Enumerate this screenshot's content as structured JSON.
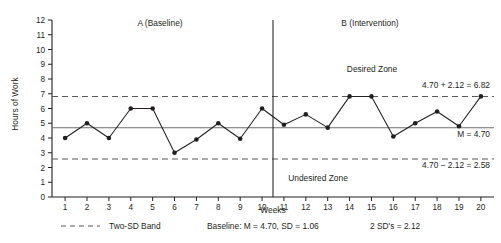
{
  "chart_data": {
    "type": "line",
    "title": "",
    "xlabel": "Weeks",
    "ylabel": "Hours of Work",
    "xlim": [
      0.4,
      20.6
    ],
    "ylim": [
      0,
      12
    ],
    "grid": false,
    "x": [
      1,
      2,
      3,
      4,
      5,
      6,
      7,
      8,
      9,
      10,
      11,
      12,
      13,
      14,
      15,
      16,
      17,
      18,
      19,
      20
    ],
    "xtick_labels": [
      "1",
      "2",
      "3",
      "4",
      "5",
      "6",
      "7",
      "8",
      "9",
      "10",
      "11",
      "12",
      "13",
      "14",
      "15",
      "16",
      "17",
      "18",
      "19",
      "20"
    ],
    "ytick_labels": [
      "0",
      "1",
      "2",
      "3",
      "4",
      "5",
      "6",
      "7",
      "8",
      "9",
      "10",
      "11",
      "12"
    ],
    "yticks": [
      0,
      1,
      2,
      3,
      4,
      5,
      6,
      7,
      8,
      9,
      10,
      11,
      12
    ],
    "series": [
      {
        "name": "Hours of Work",
        "values": [
          4.0,
          5.0,
          4.0,
          6.0,
          6.0,
          3.0,
          3.9,
          5.0,
          3.95,
          6.0,
          4.9,
          5.6,
          4.7,
          6.82,
          6.82,
          4.1,
          5.0,
          5.8,
          4.8,
          6.82
        ]
      }
    ],
    "phase_change_x": 10.5,
    "reference_lines": [
      {
        "name": "mean",
        "value": 4.7,
        "style": "solid",
        "label": "M = 4.70"
      },
      {
        "name": "upper_two_sd",
        "value": 6.82,
        "style": "dashed",
        "label": "4.70 + 2.12 = 6.82"
      },
      {
        "name": "lower_two_sd",
        "value": 2.58,
        "style": "dashed",
        "label": "4.70 − 2.12 = 2.58"
      }
    ],
    "annotations": [
      {
        "name": "phase-a-label",
        "text": "A (Baseline)"
      },
      {
        "name": "phase-b-label",
        "text": "B (Intervention)"
      },
      {
        "name": "desired-zone-label",
        "text": "Desired Zone"
      },
      {
        "name": "undesired-zone-label",
        "text": "Undesired Zone"
      }
    ],
    "legend_position": "below-axis"
  },
  "axes": {
    "y_title": "Hours of Work",
    "x_title": "Weeks"
  },
  "phases": {
    "a_label": "A (Baseline)",
    "b_label": "B (Intervention)"
  },
  "zones": {
    "desired": "Desired Zone",
    "undesired": "Undesired Zone"
  },
  "callouts": {
    "upper": "4.70 + 2.12 = 6.82",
    "mean": "M = 4.70",
    "lower": "4.70 − 2.12 = 2.58"
  },
  "legend": {
    "band_label": "Two-SD Band",
    "baseline_stats": "Baseline: M = 4.70, SD = 1.06",
    "two_sd": "2 SD's = 2.12"
  },
  "colors": {
    "ink": "#231f20",
    "mean_line": "#6d6e71",
    "band_line": "#58595b",
    "background": "#ffffff"
  }
}
